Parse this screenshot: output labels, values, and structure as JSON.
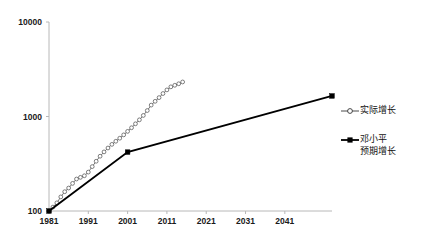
{
  "chart_data": {
    "type": "line",
    "title": "",
    "xlabel": "",
    "ylabel": "",
    "yscale": "log",
    "ylim": [
      100,
      10000
    ],
    "yticks": [
      100,
      1000,
      10000
    ],
    "ytick_labels": [
      "100",
      "1000",
      "10000"
    ],
    "xlim": [
      1981,
      2053
    ],
    "xticks": [
      1981,
      1991,
      2001,
      2011,
      2021,
      2031,
      2041
    ],
    "xtick_labels": [
      "1981",
      "1991",
      "2001",
      "2011",
      "2021",
      "2031",
      "2041"
    ],
    "grid": false,
    "legend_position": "right",
    "series": [
      {
        "name": "实际增长",
        "marker": "open-circle",
        "style": "thin-line-with-markers",
        "color": "#4a4a4a",
        "x": [
          1981,
          1982,
          1983,
          1984,
          1985,
          1986,
          1987,
          1988,
          1989,
          1990,
          1991,
          1992,
          1993,
          1994,
          1995,
          1996,
          1997,
          1998,
          1999,
          2000,
          2001,
          2002,
          2003,
          2004,
          2005,
          2006,
          2007,
          2008,
          2009,
          2010,
          2011,
          2012,
          2013,
          2014,
          2015
        ],
        "values": [
          100,
          110,
          122,
          141,
          160,
          175,
          196,
          218,
          227,
          236,
          258,
          295,
          336,
          380,
          422,
          464,
          507,
          547,
          589,
          639,
          696,
          760,
          837,
          922,
          1026,
          1156,
          1320,
          1448,
          1584,
          1750,
          1912,
          2060,
          2140,
          2220,
          2320
        ]
      },
      {
        "name": "邓小平预期增长",
        "marker": "filled-square",
        "style": "thick-line",
        "color": "#000000",
        "x": [
          1981,
          2001,
          2053
        ],
        "values": [
          100,
          420,
          1650
        ]
      }
    ]
  },
  "legend": {
    "entries": [
      {
        "label_lines": [
          "实际增长"
        ],
        "symbol": "open-circle-line-icon"
      },
      {
        "label_lines": [
          "邓小平",
          "预期增长"
        ],
        "symbol": "filled-square-line-icon"
      }
    ]
  },
  "axes": {
    "y_top_label": "10000",
    "y_mid_label": "1000",
    "y_bottom_label": "100"
  }
}
